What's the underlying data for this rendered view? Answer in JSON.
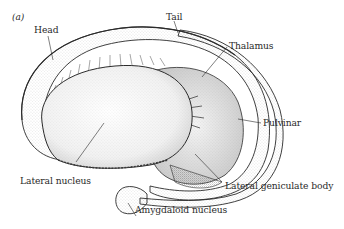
{
  "figure": {
    "panel_label": "(a)",
    "labels": {
      "head": "Head",
      "tail": "Tail",
      "thalamus": "Thalamus",
      "pulvinar": "Pulvinar",
      "lateral_nucleus": "Lateral nucleus",
      "lateral_geniculate_body": "Lateral geniculate body",
      "amygdaloid_nucleus": "Amygdaloid nucleus"
    },
    "colors": {
      "ink": "#2a2a2a",
      "stipple": "#7a7a7a",
      "background": "#ffffff"
    }
  }
}
